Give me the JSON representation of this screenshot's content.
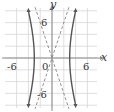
{
  "chart_data": {
    "type": "line",
    "title": "",
    "xlabel": "x",
    "ylabel": "y",
    "xlim": [
      -8,
      8
    ],
    "ylim": [
      -8.5,
      8.5
    ],
    "grid": true,
    "grid_step": 2,
    "tick_labels": {
      "x": [
        {
          "value": -6,
          "label": "-6"
        },
        {
          "value": 6,
          "label": "6"
        }
      ],
      "y": [
        {
          "value": 6,
          "label": "6"
        },
        {
          "value": -6,
          "label": "-6"
        }
      ],
      "origin": "0"
    },
    "series": [
      {
        "name": "hyperbola",
        "equation": "x^2/9 - y^2/81 = 1",
        "style": "solid",
        "a": 3,
        "b": 9
      },
      {
        "name": "asymptote-positive",
        "equation": "y = 3x",
        "style": "dashed"
      },
      {
        "name": "asymptote-negative",
        "equation": "y = -3x",
        "style": "dashed"
      }
    ]
  },
  "labels": {
    "x_axis": "x",
    "y_axis": "y",
    "x_neg": "-6",
    "x_pos": "6",
    "y_pos": "6",
    "y_neg": "-6",
    "origin": "0"
  },
  "colors": {
    "grid": "#d6d6d6",
    "axis": "#8a8a8a",
    "curve": "#555555",
    "asymptote": "#888888"
  }
}
